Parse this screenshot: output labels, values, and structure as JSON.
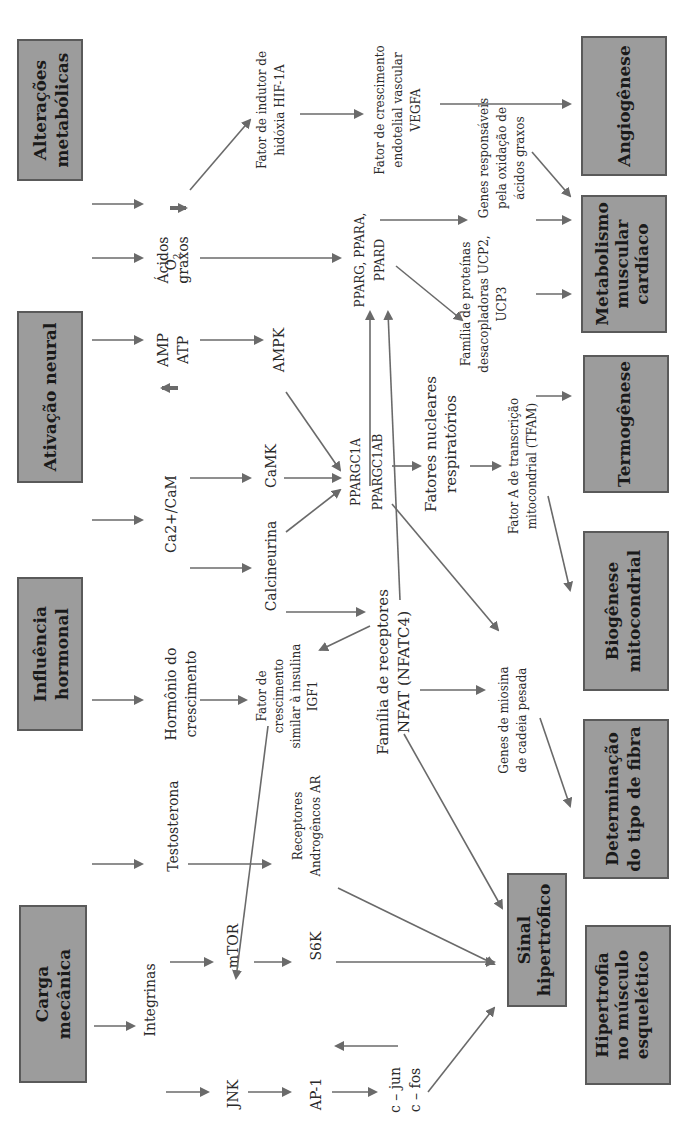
{
  "sources": [
    {
      "id": "carga",
      "lines": [
        "Carga",
        "mecânica"
      ]
    },
    {
      "id": "hormonal",
      "lines": [
        "Influência",
        "hormonal"
      ]
    },
    {
      "id": "neural",
      "lines": [
        "Ativação neural"
      ]
    },
    {
      "id": "metabolicas",
      "lines": [
        "Alterações",
        "metabólicas"
      ]
    }
  ],
  "outcomes": [
    {
      "id": "hipertrofia",
      "lines": [
        "Hipertrofia",
        "no músculo",
        "esquelético"
      ]
    },
    {
      "id": "fibra",
      "lines": [
        "Determinação",
        "do tipo de fibra"
      ]
    },
    {
      "id": "biogenese",
      "lines": [
        "Biogênese",
        "mitocondrial"
      ]
    },
    {
      "id": "termogenese",
      "lines": [
        "Termogênese"
      ]
    },
    {
      "id": "metabolismo",
      "lines": [
        "Metabolismo",
        "muscular",
        "cardíaco"
      ]
    },
    {
      "id": "angiogenese",
      "lines": [
        "Angiogênese"
      ]
    }
  ],
  "sinal": {
    "lines": [
      "Sinal",
      "hipertrófico"
    ]
  },
  "nodes": {
    "integrinas": "Integrinas",
    "jnk": "JNK",
    "ap1": "AP-1",
    "cjun": "c – jun",
    "cfos": "c – fos",
    "mtor": "mTOR",
    "s6k": "S6K",
    "testosterona": "Testosterona",
    "receptores_ar": [
      "Receptores",
      "Androgêncos AR"
    ],
    "hormonio": [
      "Hormônio do",
      "crescimento"
    ],
    "igf1": [
      "Fator de",
      "crescimento",
      "similar à insulina",
      "IGF1"
    ],
    "nfat": [
      "Família de receptores",
      "NFAT (NFATC4)"
    ],
    "miosina": [
      "Genes de miosina",
      "de cadeia pesada"
    ],
    "ca": "Ca2+/CaM",
    "calcineurina": "Calcineurina",
    "camk": "CaMK",
    "pgc1a": "PPARGC1A",
    "pgc1ab": "PPARGC1AB",
    "fatores_nucleares": [
      "Fatores nucleares",
      "respiratórios"
    ],
    "tfam": [
      "Fator A de transcrição",
      "mitocondrial (TFAM)"
    ],
    "amp": "AMP",
    "atp": "ATP",
    "ampk": "AMPK",
    "acidos": [
      "Ácidos",
      "graxos"
    ],
    "ppar": [
      "PPARG, PPARA,",
      "PPARD"
    ],
    "ucp": [
      "Família de proteínas",
      "desacopladoras UCP2,",
      "UCP3"
    ],
    "genes_oxid": [
      "Genes responsáveis",
      "pela oxidação de",
      "ácidos graxos"
    ],
    "o2": "O",
    "o2_sub": "2",
    "hif": [
      "Fator de indutor de",
      "hidóxia HIF-1A"
    ],
    "vegfa": [
      "Fator de crescimento",
      "endotelial vascular",
      "VEGFA"
    ]
  },
  "colors": {
    "box_fill": "#9c9c9c",
    "box_stroke": "#5a5a5a",
    "arrow": "#6a6a6a",
    "text": "#2a2a2a"
  }
}
